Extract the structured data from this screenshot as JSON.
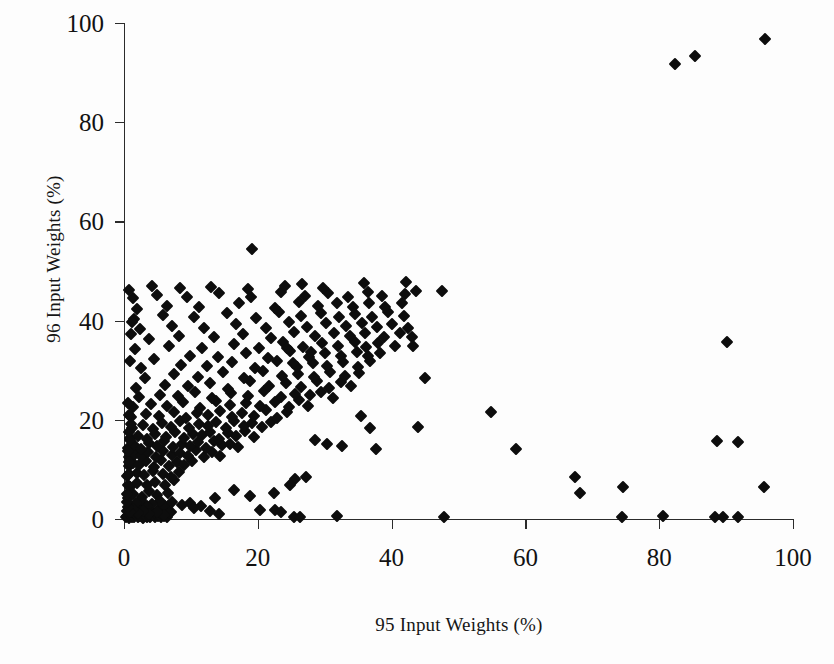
{
  "chart_data": {
    "type": "scatter",
    "title": "",
    "xlabel": "95 Input Weights (%)",
    "ylabel": "96 Input Weights (%)",
    "xlim": [
      0,
      100
    ],
    "ylim": [
      0,
      100
    ],
    "xticks": [
      0,
      20,
      40,
      60,
      80,
      100
    ],
    "yticks": [
      0,
      20,
      40,
      60,
      80,
      100
    ],
    "xtick_labels": [
      "0",
      "20",
      "40",
      "60",
      "80",
      "100"
    ],
    "ytick_labels": [
      "0",
      "20",
      "40",
      "60",
      "80",
      "100"
    ],
    "grid": false,
    "legend": null,
    "marker": "diamond",
    "marker_color": "#0d0d0d",
    "background_color": "#fdfdfd",
    "axis_color": "#2b2b2b",
    "n_points": 322,
    "points": [
      [
        0.3,
        0.4
      ],
      [
        0.5,
        0.6
      ],
      [
        0.8,
        0.3
      ],
      [
        1.0,
        0.8
      ],
      [
        1.2,
        0.4
      ],
      [
        1.5,
        0.5
      ],
      [
        1.8,
        0.9
      ],
      [
        2.1,
        0.4
      ],
      [
        2.4,
        0.6
      ],
      [
        2.8,
        0.3
      ],
      [
        3.1,
        0.7
      ],
      [
        3.5,
        0.5
      ],
      [
        3.9,
        0.4
      ],
      [
        4.3,
        0.8
      ],
      [
        4.7,
        0.5
      ],
      [
        5.1,
        0.6
      ],
      [
        5.6,
        0.4
      ],
      [
        6.0,
        0.7
      ],
      [
        6.4,
        0.5
      ],
      [
        0.4,
        1.6
      ],
      [
        0.7,
        2.2
      ],
      [
        1.1,
        1.4
      ],
      [
        1.6,
        2.8
      ],
      [
        2.3,
        1.9
      ],
      [
        3.2,
        2.4
      ],
      [
        4.1,
        1.7
      ],
      [
        5.3,
        2.1
      ],
      [
        6.2,
        2.6
      ],
      [
        7.1,
        1.5
      ],
      [
        0.6,
        4.2
      ],
      [
        1.4,
        5.1
      ],
      [
        2.7,
        4.5
      ],
      [
        3.8,
        5.6
      ],
      [
        5.0,
        4.8
      ],
      [
        6.6,
        5.3
      ],
      [
        0.9,
        6.4
      ],
      [
        2.0,
        7.2
      ],
      [
        3.4,
        6.8
      ],
      [
        4.6,
        7.5
      ],
      [
        6.1,
        6.9
      ],
      [
        7.4,
        7.8
      ],
      [
        0.5,
        8.6
      ],
      [
        1.9,
        9.3
      ],
      [
        3.0,
        8.8
      ],
      [
        4.4,
        9.6
      ],
      [
        5.8,
        9.1
      ],
      [
        7.0,
        8.4
      ],
      [
        8.2,
        9.5
      ],
      [
        0.7,
        10.6
      ],
      [
        1.3,
        11.2
      ],
      [
        2.2,
        10.8
      ],
      [
        3.3,
        11.6
      ],
      [
        4.5,
        10.4
      ],
      [
        5.5,
        11.9
      ],
      [
        6.8,
        10.7
      ],
      [
        7.9,
        11.4
      ],
      [
        9.0,
        10.9
      ],
      [
        10.2,
        11.7
      ],
      [
        0.8,
        12.6
      ],
      [
        1.7,
        13.1
      ],
      [
        2.6,
        12.8
      ],
      [
        3.6,
        13.5
      ],
      [
        4.8,
        12.4
      ],
      [
        5.9,
        13.8
      ],
      [
        7.2,
        12.9
      ],
      [
        8.4,
        13.4
      ],
      [
        9.6,
        12.7
      ],
      [
        10.8,
        13.9
      ],
      [
        11.9,
        12.5
      ],
      [
        13.1,
        13.6
      ],
      [
        14.3,
        12.8
      ],
      [
        0.6,
        14.4
      ],
      [
        1.5,
        14.9
      ],
      [
        2.5,
        14.2
      ],
      [
        3.7,
        15.3
      ],
      [
        4.9,
        14.7
      ],
      [
        6.0,
        15.8
      ],
      [
        7.3,
        14.5
      ],
      [
        8.6,
        15.1
      ],
      [
        9.8,
        14.8
      ],
      [
        11.0,
        15.5
      ],
      [
        12.2,
        14.3
      ],
      [
        13.4,
        15.7
      ],
      [
        14.6,
        14.9
      ],
      [
        15.8,
        15.2
      ],
      [
        17.0,
        14.6
      ],
      [
        0.9,
        16.3
      ],
      [
        2.1,
        16.8
      ],
      [
        3.5,
        16.1
      ],
      [
        4.7,
        17.2
      ],
      [
        6.3,
        16.6
      ],
      [
        7.6,
        17.5
      ],
      [
        8.9,
        16.4
      ],
      [
        10.3,
        17.1
      ],
      [
        11.6,
        16.9
      ],
      [
        12.9,
        17.6
      ],
      [
        14.2,
        16.2
      ],
      [
        15.5,
        17.4
      ],
      [
        16.8,
        16.7
      ],
      [
        18.1,
        17.8
      ],
      [
        19.4,
        16.5
      ],
      [
        1.2,
        18.4
      ],
      [
        2.9,
        18.9
      ],
      [
        4.3,
        18.2
      ],
      [
        5.7,
        19.3
      ],
      [
        7.0,
        18.6
      ],
      [
        8.3,
        19.7
      ],
      [
        9.7,
        18.3
      ],
      [
        11.2,
        19.1
      ],
      [
        12.5,
        18.8
      ],
      [
        13.8,
        19.5
      ],
      [
        15.2,
        18.4
      ],
      [
        16.5,
        19.8
      ],
      [
        17.9,
        18.7
      ],
      [
        19.2,
        19.4
      ],
      [
        20.6,
        18.5
      ],
      [
        21.9,
        19.6
      ],
      [
        1.0,
        20.5
      ],
      [
        3.3,
        21.1
      ],
      [
        5.2,
        20.8
      ],
      [
        7.5,
        21.6
      ],
      [
        9.2,
        20.3
      ],
      [
        10.9,
        21.4
      ],
      [
        12.6,
        20.9
      ],
      [
        14.4,
        21.8
      ],
      [
        16.1,
        20.6
      ],
      [
        17.7,
        21.3
      ],
      [
        19.5,
        20.7
      ],
      [
        21.2,
        21.9
      ],
      [
        22.8,
        20.4
      ],
      [
        24.3,
        21.5
      ],
      [
        1.4,
        22.6
      ],
      [
        4.0,
        23.2
      ],
      [
        6.5,
        22.8
      ],
      [
        8.8,
        23.5
      ],
      [
        11.4,
        22.4
      ],
      [
        13.7,
        23.8
      ],
      [
        15.9,
        22.9
      ],
      [
        18.3,
        23.4
      ],
      [
        20.4,
        22.7
      ],
      [
        22.5,
        23.6
      ],
      [
        24.6,
        22.5
      ],
      [
        26.1,
        23.9
      ],
      [
        27.5,
        22.8
      ],
      [
        2.2,
        24.5
      ],
      [
        5.4,
        25.1
      ],
      [
        8.0,
        24.7
      ],
      [
        10.6,
        25.6
      ],
      [
        13.2,
        24.3
      ],
      [
        16.0,
        25.4
      ],
      [
        18.6,
        24.8
      ],
      [
        21.0,
        25.9
      ],
      [
        23.4,
        24.6
      ],
      [
        25.6,
        25.2
      ],
      [
        27.8,
        24.9
      ],
      [
        29.5,
        25.7
      ],
      [
        31.2,
        24.4
      ],
      [
        1.8,
        26.4
      ],
      [
        6.2,
        27.1
      ],
      [
        9.5,
        26.8
      ],
      [
        12.8,
        27.5
      ],
      [
        15.6,
        26.3
      ],
      [
        18.9,
        27.8
      ],
      [
        21.7,
        26.9
      ],
      [
        24.2,
        27.4
      ],
      [
        26.5,
        26.6
      ],
      [
        28.8,
        27.9
      ],
      [
        30.6,
        26.5
      ],
      [
        32.4,
        27.6
      ],
      [
        34.0,
        26.8
      ],
      [
        3.1,
        28.5
      ],
      [
        7.4,
        29.2
      ],
      [
        11.0,
        28.7
      ],
      [
        14.8,
        29.6
      ],
      [
        17.9,
        28.4
      ],
      [
        20.8,
        29.8
      ],
      [
        23.6,
        28.9
      ],
      [
        26.0,
        29.3
      ],
      [
        28.4,
        28.6
      ],
      [
        30.8,
        29.7
      ],
      [
        33.0,
        28.8
      ],
      [
        35.2,
        29.5
      ],
      [
        2.6,
        30.4
      ],
      [
        8.5,
        31.1
      ],
      [
        12.4,
        30.8
      ],
      [
        16.2,
        31.6
      ],
      [
        19.6,
        30.5
      ],
      [
        22.9,
        31.9
      ],
      [
        25.8,
        30.7
      ],
      [
        28.2,
        31.4
      ],
      [
        30.4,
        30.9
      ],
      [
        32.8,
        31.7
      ],
      [
        35.0,
        30.6
      ],
      [
        36.8,
        31.8
      ],
      [
        4.5,
        32.3
      ],
      [
        9.8,
        32.9
      ],
      [
        14.0,
        32.6
      ],
      [
        18.2,
        33.4
      ],
      [
        21.5,
        32.5
      ],
      [
        24.8,
        33.8
      ],
      [
        27.6,
        32.7
      ],
      [
        30.0,
        33.5
      ],
      [
        32.5,
        32.8
      ],
      [
        34.8,
        33.6
      ],
      [
        36.5,
        32.9
      ],
      [
        38.2,
        33.4
      ],
      [
        1.6,
        34.2
      ],
      [
        6.8,
        34.8
      ],
      [
        11.6,
        34.5
      ],
      [
        16.5,
        35.2
      ],
      [
        20.2,
        34.4
      ],
      [
        23.8,
        35.6
      ],
      [
        26.8,
        34.7
      ],
      [
        29.6,
        35.4
      ],
      [
        32.0,
        34.9
      ],
      [
        34.5,
        35.7
      ],
      [
        36.2,
        34.6
      ],
      [
        38.0,
        35.5
      ],
      [
        40.5,
        34.8
      ],
      [
        3.8,
        36.3
      ],
      [
        8.2,
        36.9
      ],
      [
        13.5,
        36.6
      ],
      [
        17.8,
        37.3
      ],
      [
        22.0,
        36.5
      ],
      [
        25.4,
        37.7
      ],
      [
        28.6,
        36.8
      ],
      [
        31.4,
        37.5
      ],
      [
        33.8,
        36.9
      ],
      [
        36.0,
        37.6
      ],
      [
        38.8,
        36.7
      ],
      [
        41.2,
        37.4
      ],
      [
        43.0,
        36.6
      ],
      [
        2.4,
        38.4
      ],
      [
        7.2,
        38.9
      ],
      [
        12.0,
        38.6
      ],
      [
        16.8,
        39.4
      ],
      [
        21.2,
        38.5
      ],
      [
        24.6,
        39.8
      ],
      [
        27.4,
        38.7
      ],
      [
        30.2,
        39.5
      ],
      [
        33.2,
        38.9
      ],
      [
        35.6,
        39.6
      ],
      [
        37.8,
        38.8
      ],
      [
        40.0,
        39.4
      ],
      [
        42.4,
        38.6
      ],
      [
        1.5,
        40.4
      ],
      [
        5.8,
        41.1
      ],
      [
        10.5,
        40.7
      ],
      [
        15.4,
        41.5
      ],
      [
        19.8,
        40.6
      ],
      [
        23.2,
        41.8
      ],
      [
        26.4,
        40.9
      ],
      [
        29.4,
        41.6
      ],
      [
        32.2,
        40.8
      ],
      [
        34.6,
        41.4
      ],
      [
        37.0,
        40.7
      ],
      [
        39.4,
        41.7
      ],
      [
        41.8,
        40.9
      ],
      [
        2.0,
        42.4
      ],
      [
        6.4,
        43.0
      ],
      [
        11.2,
        42.7
      ],
      [
        17.2,
        43.5
      ],
      [
        22.6,
        42.6
      ],
      [
        26.2,
        43.8
      ],
      [
        29.0,
        42.9
      ],
      [
        31.8,
        43.6
      ],
      [
        34.2,
        42.8
      ],
      [
        36.6,
        43.5
      ],
      [
        39.0,
        42.7
      ],
      [
        41.5,
        43.6
      ],
      [
        1.3,
        44.5
      ],
      [
        5.0,
        45.1
      ],
      [
        9.4,
        44.8
      ],
      [
        14.2,
        45.6
      ],
      [
        19.0,
        44.7
      ],
      [
        23.5,
        45.8
      ],
      [
        27.0,
        44.9
      ],
      [
        30.5,
        45.5
      ],
      [
        33.5,
        44.8
      ],
      [
        36.4,
        45.7
      ],
      [
        38.6,
        44.9
      ],
      [
        42.0,
        45.4
      ],
      [
        0.8,
        46.2
      ],
      [
        4.2,
        46.9
      ],
      [
        8.4,
        46.5
      ],
      [
        13.0,
        46.8
      ],
      [
        18.5,
        46.4
      ],
      [
        24.0,
        47.0
      ],
      [
        26.6,
        47.4
      ],
      [
        29.8,
        46.6
      ],
      [
        35.8,
        47.6
      ],
      [
        42.2,
        47.8
      ],
      [
        47.5,
        46.0
      ],
      [
        43.6,
        45.9
      ],
      [
        19.2,
        54.5
      ],
      [
        54.8,
        21.5
      ],
      [
        58.6,
        14.2
      ],
      [
        67.4,
        8.4
      ],
      [
        68.2,
        5.3
      ],
      [
        74.6,
        6.5
      ],
      [
        74.4,
        0.5
      ],
      [
        80.6,
        0.6
      ],
      [
        82.4,
        91.8
      ],
      [
        85.4,
        93.4
      ],
      [
        90.2,
        35.6
      ],
      [
        88.6,
        15.8
      ],
      [
        91.8,
        15.6
      ],
      [
        95.8,
        96.8
      ],
      [
        95.6,
        6.4
      ],
      [
        88.4,
        0.5
      ],
      [
        89.6,
        0.5
      ],
      [
        91.8,
        0.5
      ],
      [
        47.8,
        0.5
      ],
      [
        31.8,
        0.6
      ],
      [
        25.4,
        0.5
      ],
      [
        26.3,
        0.5
      ],
      [
        14.2,
        1.0
      ],
      [
        20.4,
        1.8
      ],
      [
        22.6,
        1.9
      ],
      [
        23.4,
        1.4
      ],
      [
        11.5,
        2.6
      ],
      [
        9.8,
        3.2
      ],
      [
        8.6,
        2.9
      ],
      [
        7.2,
        3.4
      ],
      [
        10.4,
        2.2
      ],
      [
        12.8,
        1.6
      ],
      [
        5.4,
        3.6
      ],
      [
        4.2,
        3.1
      ],
      [
        3.4,
        2.7
      ],
      [
        2.6,
        3.8
      ],
      [
        1.8,
        3.3
      ],
      [
        6.8,
        1.2
      ],
      [
        6.0,
        0.9
      ],
      [
        4.9,
        1.4
      ],
      [
        3.7,
        1.1
      ],
      [
        2.9,
        1.7
      ],
      [
        2.1,
        1.3
      ],
      [
        1.4,
        2.0
      ],
      [
        0.9,
        1.5
      ],
      [
        0.6,
        2.5
      ],
      [
        0.4,
        3.5
      ],
      [
        0.5,
        5.0
      ],
      [
        0.6,
        6.8
      ],
      [
        0.7,
        9.0
      ],
      [
        0.8,
        11.5
      ],
      [
        0.6,
        13.8
      ],
      [
        0.9,
        15.9
      ],
      [
        0.7,
        17.6
      ],
      [
        1.0,
        19.2
      ],
      [
        0.8,
        21.0
      ],
      [
        0.6,
        23.4
      ],
      [
        0.9,
        31.8
      ],
      [
        1.1,
        37.2
      ],
      [
        1.2,
        39.8
      ],
      [
        25.6,
        8.0
      ],
      [
        27.2,
        8.4
      ],
      [
        24.8,
        6.8
      ],
      [
        22.4,
        5.2
      ],
      [
        18.8,
        4.6
      ],
      [
        16.4,
        5.8
      ],
      [
        13.6,
        4.2
      ],
      [
        44.0,
        18.6
      ],
      [
        36.8,
        18.4
      ],
      [
        35.4,
        20.8
      ],
      [
        37.6,
        14.2
      ],
      [
        32.6,
        14.8
      ],
      [
        30.4,
        15.2
      ],
      [
        28.6,
        16.0
      ],
      [
        43.2,
        34.8
      ],
      [
        45.0,
        28.4
      ],
      [
        27.9,
        33.6
      ],
      [
        24.4,
        34.4
      ],
      [
        25.2,
        31.4
      ]
    ]
  },
  "axis": {
    "x_title": "95 Input Weights (%)",
    "y_title": "96 Input Weights (%)",
    "x_labels": [
      "0",
      "20",
      "40",
      "60",
      "80",
      "100"
    ],
    "y_labels": [
      "0",
      "20",
      "40",
      "60",
      "80",
      "100"
    ]
  }
}
